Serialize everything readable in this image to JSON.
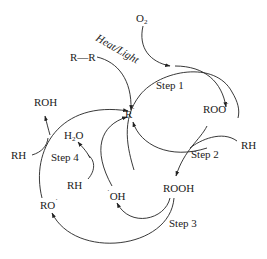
{
  "diagram": {
    "nodes": {
      "o2": "O",
      "o2_sub": "2",
      "rr": "R—R",
      "heat_light": "Heat/Light",
      "r_radical": "R",
      "r_dot": "˙",
      "roo_radical": "ROO",
      "roo_dot": "˙",
      "rh_right": "RH",
      "rooh": "ROOH",
      "oh_radical": "OH",
      "oh_dot": "˙",
      "rh_center": "RH",
      "h2o_h": "H",
      "h2o_sub": "2",
      "h2o_o": "O",
      "rh_left": "RH",
      "roh": "ROH",
      "ro_radical": "RO",
      "ro_dot": "˙"
    },
    "steps": {
      "step1": "Step 1",
      "step2": "Step 2",
      "step3": "Step 3",
      "step4": "Step 4"
    },
    "colors": {
      "ink": "#222222",
      "background": "#ffffff"
    }
  }
}
